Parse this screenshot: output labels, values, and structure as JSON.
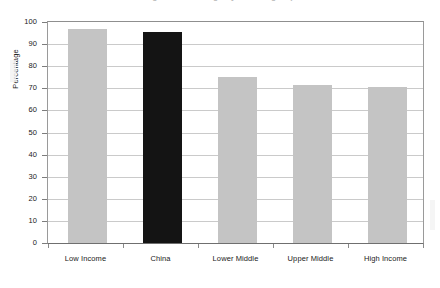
{
  "chart_data": {
    "type": "bar",
    "title": "",
    "xlabel": "",
    "ylabel": "Percentage",
    "categories": [
      "Low Income",
      "China",
      "Lower Middle",
      "Upper Middle",
      "High Income"
    ],
    "values": [
      96.8,
      95.3,
      75.3,
      71.4,
      70.4
    ],
    "ylim": [
      0,
      100
    ],
    "ytick_values": [
      0,
      10,
      20,
      30,
      40,
      50,
      60,
      70,
      80,
      90,
      100
    ],
    "ytick_labels": [
      "0",
      "10",
      "20",
      "30",
      "40",
      "50",
      "60",
      "70",
      "80",
      "90",
      "100"
    ],
    "grid": "horizontal",
    "legend": "none",
    "bar_colors": [
      "#c4c4c4",
      "#141414",
      "#c4c4c4",
      "#c4c4c4",
      "#c4c4c4"
    ],
    "highlight_category": "China"
  },
  "figure": {
    "title_clipped": "Figure: Percentage by income group",
    "axis": {
      "y_title": "Percentage",
      "frame_color": "#8f8f8f",
      "grid_color": "#cacaca",
      "tick_color": "#7d7d7d"
    },
    "colors": {
      "bar_gray": "#c4c4c4",
      "bar_black": "#141414",
      "background": "#ffffff",
      "text": "#1a1a1a"
    }
  }
}
